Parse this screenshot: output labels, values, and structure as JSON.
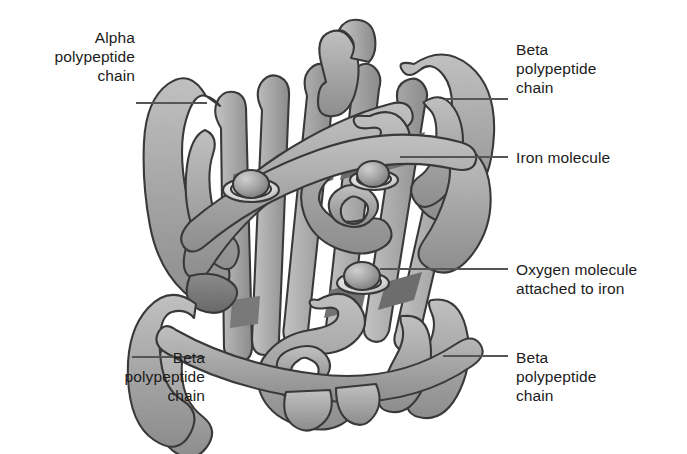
{
  "figure": {
    "background_color": "#ffffff",
    "ribbon_fill": "#a8a8a8",
    "ribbon_shadow": "#8a8a8a",
    "ribbon_dark": "#6e6e6e",
    "ribbon_highlight": "#c9c9c9",
    "outline_color": "#3a3a3a",
    "leader_color": "#555555",
    "text_color": "#1b1b1b"
  },
  "labels": [
    {
      "id": "alpha-chain",
      "text": "Alpha\npolypeptide\nchain",
      "side": "left",
      "x": 150,
      "y": 28,
      "leader": {
        "x1": 136,
        "y1": 103,
        "x2": 207,
        "y2": 103
      }
    },
    {
      "id": "beta-chain-top-right",
      "text": "Beta\npolypeptide\nchain",
      "side": "right",
      "x": 516,
      "y": 40,
      "leader": {
        "x1": 445,
        "y1": 99,
        "x2": 508,
        "y2": 99
      }
    },
    {
      "id": "iron-molecule",
      "text": "Iron molecule",
      "side": "right",
      "x": 516,
      "y": 148,
      "leader": {
        "x1": 400,
        "y1": 157,
        "x2": 508,
        "y2": 157
      }
    },
    {
      "id": "oxygen-molecule",
      "text": "Oxygen molecule\nattached to iron",
      "side": "right",
      "x": 516,
      "y": 260,
      "leader": {
        "x1": 380,
        "y1": 269,
        "x2": 508,
        "y2": 269
      }
    },
    {
      "id": "beta-chain-bottom-left",
      "text": "Beta\npolypeptide\nchain",
      "side": "left",
      "x": 170,
      "y": 348,
      "leader": {
        "x1": 132,
        "y1": 357,
        "x2": 205,
        "y2": 357
      }
    },
    {
      "id": "beta-chain-bottom-right",
      "text": "Beta\npolypeptide\nchain",
      "side": "right",
      "x": 516,
      "y": 348,
      "leader": {
        "x1": 443,
        "y1": 356,
        "x2": 508,
        "y2": 356
      }
    }
  ],
  "structure": {
    "iron_sites": [
      {
        "id": "iron-site-left",
        "cx": 251,
        "cy": 188,
        "r": 17
      },
      {
        "id": "iron-site-right",
        "cx": 374,
        "cy": 178,
        "r": 16
      }
    ],
    "oxygen_sites": [
      {
        "id": "oxygen-site",
        "cx": 363,
        "cy": 281,
        "r": 17
      }
    ]
  }
}
